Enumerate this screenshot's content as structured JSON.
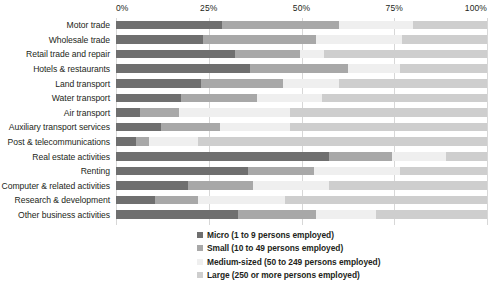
{
  "chart_data": {
    "type": "bar",
    "orientation": "horizontal",
    "stacked": true,
    "stack_mode": "percent",
    "title": "",
    "subtitle": "",
    "xlabel": "",
    "ylabel": "",
    "xlim": [
      0,
      100
    ],
    "xticks": [
      0,
      25,
      50,
      75,
      100
    ],
    "xticklabels": [
      "0%",
      "25%",
      "50%",
      "75%",
      "100%"
    ],
    "grid": true,
    "grid_axis": "x",
    "legend_position": "bottom-right",
    "categories": [
      "Motor trade",
      "Wholesale trade",
      "Retail trade and repair",
      "Hotels & restaurants",
      "Land transport",
      "Water transport",
      "Air transport",
      "Auxiliary transport services",
      "Post & telecommunications",
      "Real estate activities",
      "Renting",
      "Computer & related activities",
      "Research & development",
      "Other business activities"
    ],
    "series": [
      {
        "name": "Micro (1 to 9 persons employed)",
        "color": "#6f6f6f",
        "values": [
          28.5,
          23.5,
          32.0,
          36.0,
          23.0,
          17.5,
          6.5,
          12.0,
          5.5,
          57.5,
          35.5,
          19.5,
          10.5,
          33.0
        ]
      },
      {
        "name": "Small (10 to 49 persons employed)",
        "color": "#a8a8a8",
        "values": [
          31.5,
          30.5,
          17.5,
          26.5,
          22.0,
          20.5,
          10.5,
          16.0,
          3.5,
          17.0,
          18.0,
          17.5,
          11.5,
          21.0
        ]
      },
      {
        "name": "Medium-sized (50 to 249 persons employed)",
        "color": "#efefef",
        "values": [
          20.0,
          23.0,
          6.5,
          14.0,
          15.0,
          17.5,
          30.0,
          19.0,
          13.0,
          14.5,
          23.0,
          20.5,
          23.5,
          16.0
        ]
      },
      {
        "name": "Large (250 or more persons employed)",
        "color": "#cecece",
        "values": [
          20.0,
          23.0,
          44.0,
          23.5,
          40.0,
          44.5,
          53.0,
          53.0,
          78.0,
          11.0,
          23.5,
          42.5,
          54.5,
          30.0
        ]
      }
    ],
    "legend": [
      "Micro (1 to 9 persons employed)",
      "Small (10 to 49 persons employed)",
      "Medium-sized (50 to 249 persons employed)",
      "Large (250 or more persons employed)"
    ],
    "colors": {
      "micro": "#6f6f6f",
      "small": "#a8a8a8",
      "medium": "#efefef",
      "large": "#cecece",
      "grid": "#d7d7d7",
      "text": "#231f20",
      "background": "#ffffff"
    }
  }
}
